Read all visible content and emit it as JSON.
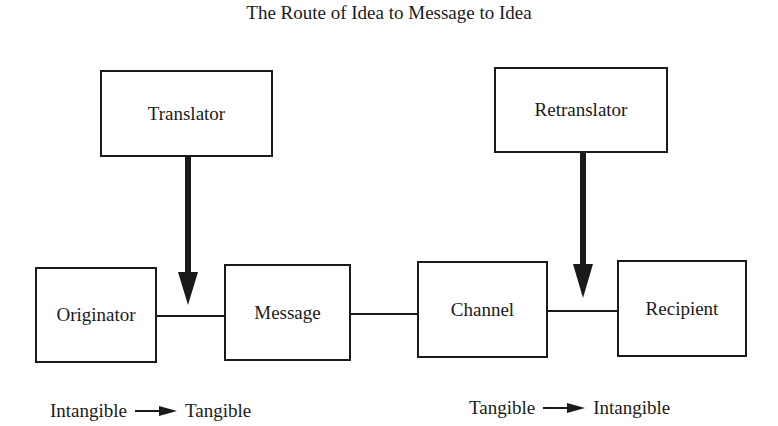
{
  "title": "The Route of Idea to Message to Idea",
  "boxes": {
    "translator": "Translator",
    "retranslator": "Retranslator",
    "originator": "Originator",
    "message": "Message",
    "channel": "Channel",
    "recipient": "Recipient"
  },
  "annotations": {
    "left": {
      "from": "Intangible",
      "to": "Tangible"
    },
    "right": {
      "from": "Tangible",
      "to": "Intangible"
    }
  },
  "colors": {
    "stroke": "#1a1a1a",
    "background": "#ffffff"
  }
}
